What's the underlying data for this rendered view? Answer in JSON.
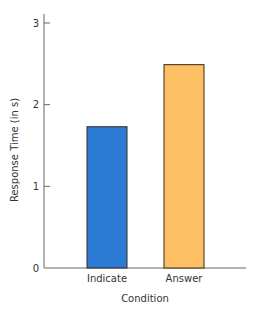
{
  "chart_data": {
    "type": "bar",
    "title": "",
    "xlabel": "Condition",
    "ylabel": "Response Time (in s)",
    "categories": [
      "Indicate",
      "Answer"
    ],
    "values": [
      1.73,
      2.49
    ],
    "colors": [
      "#2b7bd6",
      "#fdbf63"
    ],
    "bar_edge_color": "#3a2a1a",
    "ylim": [
      0,
      3
    ],
    "yticks": [
      0,
      1,
      2,
      3
    ],
    "ytick_labels": [
      "0",
      "1",
      "2",
      "3"
    ],
    "grid": false,
    "legend": "none"
  }
}
